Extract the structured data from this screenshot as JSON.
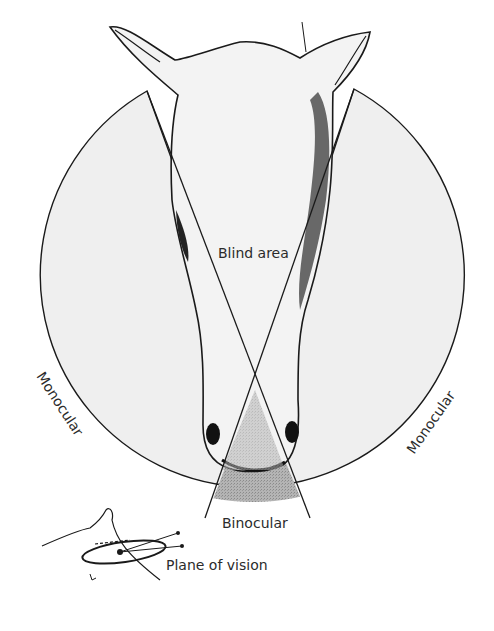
{
  "diagram": {
    "title": "",
    "labels": {
      "blind_area": "Blind area",
      "monocular_left": "Monocular",
      "monocular_right": "Monocular",
      "binocular": "Binocular",
      "plane_of_vision": "Plane of vision"
    },
    "colors": {
      "background": "#ffffff",
      "field_fill": "#efefef",
      "head_fill": "#f2f2f2",
      "binocular_fill": "#a8a8a8",
      "line": "#1a1a1a",
      "text": "#2b2b2b"
    },
    "regions": [
      {
        "name": "left monocular field"
      },
      {
        "name": "right monocular field"
      },
      {
        "name": "binocular field"
      },
      {
        "name": "blind area"
      }
    ]
  }
}
